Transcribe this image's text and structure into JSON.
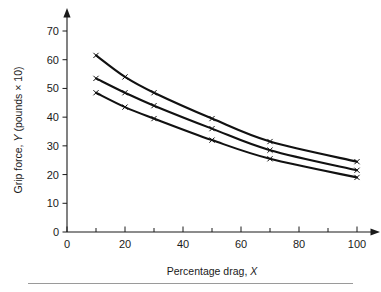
{
  "figure": {
    "background": "#ffffff",
    "curve_color": "#111111",
    "axis_color": "#1a1a1a",
    "rule_color": "#9a9a9a",
    "marker_symbol": "x"
  },
  "axes": {
    "x": {
      "title_main": "Percentage drag,",
      "title_italic": "X",
      "ticks": [
        0,
        20,
        40,
        60,
        80,
        100
      ],
      "tick_labels": [
        "0",
        "20",
        "40",
        "60",
        "80",
        "100"
      ],
      "minor_tick_step": 10,
      "range": [
        0,
        100
      ],
      "has_arrow": true
    },
    "y": {
      "title_part1": "Grip force,",
      "title_italic": "Y",
      "title_part2": "(pounds × 10)",
      "title_full": "Grip force, Y (pounds × 10)",
      "ticks": [
        0,
        10,
        20,
        30,
        40,
        50,
        60,
        70
      ],
      "tick_labels": [
        "0",
        "10",
        "20",
        "30",
        "40",
        "50",
        "60",
        "70"
      ],
      "range": [
        0,
        70
      ],
      "has_arrow": true
    }
  },
  "chart_data": {
    "type": "line",
    "title": "",
    "subtitle": "",
    "xlabel": "Percentage drag, X",
    "ylabel": "Grip force, Y (pounds × 10)",
    "xlim": [
      0,
      100
    ],
    "ylim": [
      0,
      70
    ],
    "xticks": [
      0,
      20,
      40,
      60,
      80,
      100
    ],
    "yticks": [
      0,
      10,
      20,
      30,
      40,
      50,
      60,
      70
    ],
    "grid": false,
    "legend": null,
    "legend_position": "none",
    "marker": "x",
    "x": [
      10,
      20,
      30,
      50,
      70,
      100
    ],
    "series": [
      {
        "name": "upper",
        "values": [
          61.5,
          54.0,
          48.5,
          39.5,
          31.5,
          24.5
        ]
      },
      {
        "name": "middle",
        "values": [
          53.5,
          48.5,
          44.0,
          36.0,
          28.5,
          21.5
        ]
      },
      {
        "name": "lower",
        "values": [
          48.5,
          43.5,
          39.5,
          32.0,
          25.5,
          19.0
        ]
      }
    ],
    "annotations": []
  },
  "footer": {
    "divider": true
  }
}
